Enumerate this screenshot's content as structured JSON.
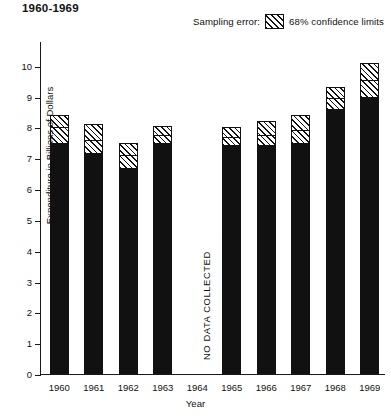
{
  "title": "1960-1969",
  "legend": {
    "prefix": "Sampling error:",
    "swatch_name": "hatched-swatch",
    "label": "68% confidence limits"
  },
  "axes": {
    "ylabel": "Expenditure in Billions of Dollars",
    "xlabel": "Year",
    "yticks": [
      "0",
      "1",
      "2",
      "3",
      "4",
      "5",
      "6",
      "7",
      "8",
      "9",
      "10"
    ]
  },
  "annotations": {
    "no_data": "NO DATA COLLECTED"
  },
  "colors": {
    "bar": "#111111",
    "axis": "#1a1a1a",
    "background": "#ffffff",
    "hatch": "#111111"
  },
  "chart_data": {
    "type": "bar",
    "title": "1960-1969",
    "xlabel": "Year",
    "ylabel": "Expenditure in Billions of Dollars",
    "ylim": [
      0,
      10.8
    ],
    "grid": false,
    "legend_position": "top-right",
    "categories": [
      "1960",
      "1961",
      "1962",
      "1963",
      "1964",
      "1965",
      "1966",
      "1967",
      "1968",
      "1969"
    ],
    "values": [
      7.45,
      7.15,
      6.65,
      7.45,
      null,
      7.4,
      7.4,
      7.45,
      8.55,
      8.95
    ],
    "ci_mid": [
      8.0,
      7.6,
      7.1,
      7.75,
      null,
      7.7,
      7.75,
      7.9,
      8.95,
      9.55
    ],
    "ci_upper": [
      8.4,
      8.1,
      7.5,
      8.05,
      null,
      8.0,
      8.2,
      8.4,
      9.3,
      10.1
    ],
    "missing": [
      "1964"
    ],
    "missing_note": "NO DATA COLLECTED",
    "series": [
      {
        "name": "Expenditure",
        "values": [
          7.45,
          7.15,
          6.65,
          7.45,
          null,
          7.4,
          7.4,
          7.45,
          8.55,
          8.95
        ]
      },
      {
        "name": "68% confidence limits (upper)",
        "values": [
          8.4,
          8.1,
          7.5,
          8.05,
          null,
          8.0,
          8.2,
          8.4,
          9.3,
          10.1
        ]
      }
    ]
  }
}
